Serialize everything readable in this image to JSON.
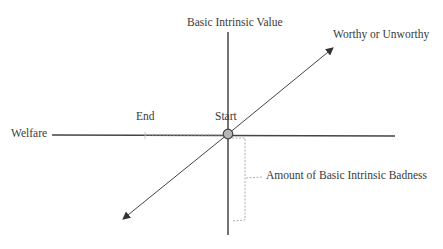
{
  "diagram": {
    "labels": {
      "vertical_axis": "Basic Intrinsic Value",
      "diagonal_axis": "Worthy or Unworthy",
      "horizontal_axis": "Welfare",
      "end": "End",
      "start": "Start",
      "bracket": "Amount of Basic Intrinsic Badness"
    },
    "colors": {
      "axis": "#444444",
      "dashed": "#999999",
      "start_point_fill": "#b5b5b5",
      "start_point_stroke": "#444444"
    }
  }
}
